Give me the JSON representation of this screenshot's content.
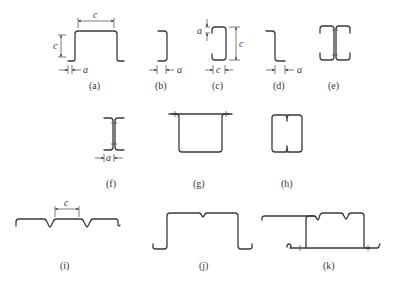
{
  "figure": {
    "panels": [
      {
        "id": "a",
        "label": "(a)",
        "dims": [
          "c",
          "c",
          "a"
        ]
      },
      {
        "id": "b",
        "label": "(b)",
        "dims": [
          "a"
        ]
      },
      {
        "id": "c",
        "label": "(c)",
        "dims": [
          "a",
          "c",
          "c"
        ]
      },
      {
        "id": "d",
        "label": "(d)",
        "dims": [
          "a"
        ]
      },
      {
        "id": "e",
        "label": "(e)",
        "dims": []
      },
      {
        "id": "f",
        "label": "(f)",
        "dims": [
          "a"
        ]
      },
      {
        "id": "g",
        "label": "(g)",
        "dims": []
      },
      {
        "id": "h",
        "label": "(h)",
        "dims": []
      },
      {
        "id": "i",
        "label": "(i)",
        "dims": [
          "c"
        ]
      },
      {
        "id": "j",
        "label": "(j)",
        "dims": []
      },
      {
        "id": "k",
        "label": "(k)",
        "dims": []
      }
    ]
  }
}
